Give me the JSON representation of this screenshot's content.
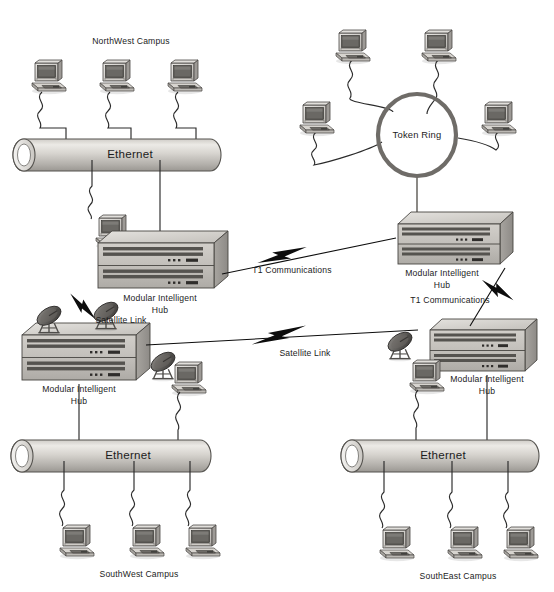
{
  "diagram": {
    "type": "network-topology",
    "background": "#ffffff",
    "ink": "#1c1c1c"
  },
  "labels": {
    "northwest_campus": "NorthWest Campus",
    "southwest_campus": "SouthWest Campus",
    "southeast_campus": "SouthEast Campus",
    "ethernet": "Ethernet",
    "token_ring": "Token Ring",
    "hub_line1": "Modular Intelligent",
    "hub_line2": "Hub",
    "t1": "T1 Communications",
    "satellite": "Satellite Link"
  },
  "segments": [
    {
      "name": "northwest-campus",
      "label": "NorthWest Campus",
      "medium": "Ethernet",
      "workstations": 3
    },
    {
      "name": "token-ring",
      "label": "Token Ring",
      "medium": "Token Ring",
      "workstations": 4
    },
    {
      "name": "southwest-campus",
      "label": "SouthWest Campus",
      "medium": "Ethernet",
      "workstations": 3
    },
    {
      "name": "southeast-campus",
      "label": "SouthEast Campus",
      "medium": "Ethernet",
      "workstations": 3
    }
  ],
  "hubs": [
    {
      "name": "hub-northwest",
      "label": "Modular Intelligent Hub"
    },
    {
      "name": "hub-tokenring",
      "label": "Modular Intelligent Hub"
    },
    {
      "name": "hub-southwest",
      "label": "Modular Intelligent Hub"
    },
    {
      "name": "hub-southeast",
      "label": "Modular Intelligent Hub"
    }
  ],
  "links": [
    {
      "name": "t1-northwest-tokenring",
      "label": "T1 Communications",
      "kind": "lightning"
    },
    {
      "name": "t1-tokenring-southeast",
      "label": "T1 Communications",
      "kind": "lightning"
    },
    {
      "name": "satellite-northwest-southwest",
      "label": "Satellite Link",
      "kind": "lightning"
    },
    {
      "name": "satellite-southwest-southeast",
      "label": "Satellite Link",
      "kind": "lightning"
    }
  ],
  "colors": {
    "cylinder_light": "#e6e4e0",
    "cylinder_mid": "#b9b6b1",
    "cylinder_dark": "#8f8c88",
    "hub_top": "#d9d7d3",
    "hub_face": "#c6c3bf",
    "hub_side": "#9b9894",
    "outline": "#3a3a3a",
    "screen": "#4a4a4a",
    "cable": "#2b2b2b"
  }
}
